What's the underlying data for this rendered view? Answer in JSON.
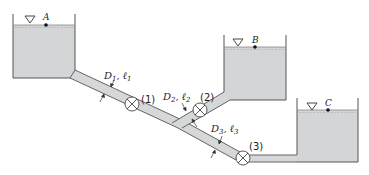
{
  "diagram": {
    "colors": {
      "water": "#d3d5d6",
      "pipe": "#d5d7d8",
      "outline": "#555555",
      "background": "#ffffff"
    },
    "reservoirs": [
      {
        "id": "A",
        "label": "A"
      },
      {
        "id": "B",
        "label": "B"
      },
      {
        "id": "C",
        "label": "C"
      }
    ],
    "valves": [
      {
        "id": "1",
        "label": "(1)"
      },
      {
        "id": "2",
        "label": "(2)"
      },
      {
        "id": "3",
        "label": "(3)"
      }
    ],
    "pipes": [
      {
        "id": "1",
        "D": "D",
        "D_sub": "1",
        "sep": ", ",
        "l": "ℓ",
        "l_sub": "1"
      },
      {
        "id": "2",
        "D": "D",
        "D_sub": "2",
        "sep": ", ",
        "l": "ℓ",
        "l_sub": "2"
      },
      {
        "id": "3",
        "D": "D",
        "D_sub": "3",
        "sep": ", ",
        "l": "ℓ",
        "l_sub": "3"
      }
    ],
    "icons": {
      "free_surface": "inverted-triangle",
      "valve": "circle-with-x"
    }
  }
}
